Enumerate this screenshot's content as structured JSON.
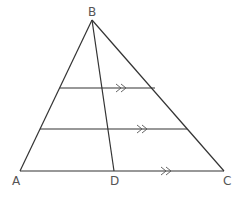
{
  "diagram": {
    "colors": {
      "line": "#333333",
      "label": "#555555",
      "background": "#ffffff"
    },
    "points": {
      "A": {
        "label": "A",
        "x": 20,
        "y": 171
      },
      "B": {
        "label": "B",
        "x": 92,
        "y": 20
      },
      "C": {
        "label": "C",
        "x": 224,
        "y": 171
      },
      "D": {
        "label": "D",
        "x": 114,
        "y": 171
      }
    },
    "segments": [
      {
        "name": "AB",
        "from": "A",
        "to": "B"
      },
      {
        "name": "BC",
        "from": "B",
        "to": "C"
      },
      {
        "name": "AC",
        "from": "A",
        "to": "C"
      },
      {
        "name": "BD",
        "from": "B",
        "to": "D"
      }
    ],
    "parallel_lines": [
      {
        "name": "upper-parallel",
        "y": 88,
        "x1": 60,
        "x2": 155,
        "arrow_x": 122
      },
      {
        "name": "middle-parallel",
        "y": 129,
        "x1": 40,
        "x2": 187,
        "arrow_x": 143
      },
      {
        "name": "base-AC",
        "y": 171,
        "x1": 20,
        "x2": 224,
        "arrow_x": 167
      }
    ],
    "parallel_mark": ">>"
  }
}
